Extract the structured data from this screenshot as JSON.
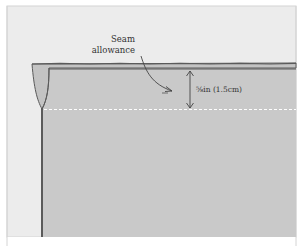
{
  "figure": {
    "labels": {
      "seam_line1": "Seam",
      "seam_line2": "allowance",
      "measurement": "⅝in (1.5cm)"
    },
    "colors": {
      "background": "#ececec",
      "frame": "#cfcfcf",
      "fabric": "#c9c9c9",
      "fabric_fold": "#c3c3c3",
      "edge_line": "#5a5a5a",
      "stitch_line": "#ffffff",
      "text": "#333333",
      "bottom_band": "#ffffff"
    },
    "icons": {
      "pointer_arrow": "curved-arrow",
      "measure_arrow": "double-headed-vertical-arrow"
    }
  }
}
